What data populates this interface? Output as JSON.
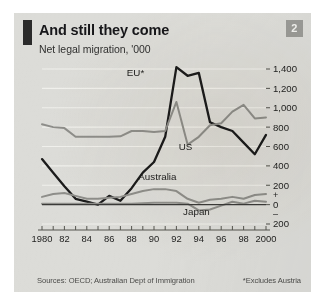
{
  "figure": {
    "title": "And still they come",
    "subtitle": "Net legal migration, '000",
    "badge": "2",
    "source": "Sources: OECD; Australian Dept of Immigration",
    "footnote": "*Excludes Austria",
    "colors": {
      "background": "#dcdcd8",
      "accent_bar": "#2b2b2b",
      "badge": "#9a9a96",
      "eu_line": "#1b1b1b",
      "other_line": "#8e8e8a",
      "gridline": "#f0f0ec",
      "zero_line": "#3a3a38"
    }
  },
  "chart_data": {
    "type": "line",
    "title": "And still they come",
    "subtitle": "Net legal migration, '000",
    "xlabel": "",
    "ylabel": "Net legal migration, '000",
    "ylim": [
      -200,
      1400
    ],
    "yticks": [
      -200,
      0,
      200,
      400,
      600,
      800,
      1000,
      1200,
      1400
    ],
    "ytick_labels": [
      "200",
      "0",
      "200",
      "400",
      "600",
      "800",
      "1,000",
      "1,200",
      "1,400"
    ],
    "sign_labels": {
      "plus": "+",
      "minus": "–"
    },
    "grid": true,
    "legend": "inline-labels",
    "x": [
      1980,
      1981,
      1982,
      1983,
      1984,
      1985,
      1986,
      1987,
      1988,
      1989,
      1990,
      1991,
      1992,
      1993,
      1994,
      1995,
      1996,
      1997,
      1998,
      1999,
      2000
    ],
    "xtick_labels": [
      "1980",
      "82",
      "84",
      "86",
      "88",
      "90",
      "92",
      "94",
      "96",
      "98",
      "2000"
    ],
    "series": [
      {
        "name": "EU*",
        "label": "EU*",
        "color": "#1b1b1b",
        "values": [
          470,
          330,
          190,
          60,
          30,
          0,
          90,
          40,
          170,
          330,
          440,
          700,
          1420,
          1330,
          1360,
          850,
          800,
          760,
          640,
          520,
          720
        ]
      },
      {
        "name": "US",
        "label": "US",
        "color": "#8e8e8a",
        "values": [
          830,
          800,
          790,
          700,
          700,
          700,
          700,
          705,
          760,
          760,
          750,
          760,
          1060,
          620,
          700,
          820,
          840,
          960,
          1030,
          890,
          900
        ]
      },
      {
        "name": "Australia",
        "label": "Australia",
        "color": "#8e8e8a",
        "values": [
          80,
          110,
          120,
          90,
          60,
          60,
          70,
          80,
          110,
          140,
          160,
          160,
          140,
          60,
          20,
          50,
          60,
          80,
          60,
          100,
          110
        ]
      },
      {
        "name": "Japan",
        "label": "Japan",
        "color": "#8e8e8a",
        "values": [
          10,
          10,
          10,
          10,
          10,
          10,
          10,
          10,
          10,
          15,
          20,
          20,
          20,
          10,
          -60,
          -50,
          -10,
          30,
          10,
          40,
          30
        ]
      }
    ],
    "annotations": [
      {
        "text": "EU*",
        "series": "EU*"
      },
      {
        "text": "US",
        "series": "US"
      },
      {
        "text": "Australia",
        "series": "Australia"
      },
      {
        "text": "Japan",
        "series": "Japan"
      }
    ]
  }
}
